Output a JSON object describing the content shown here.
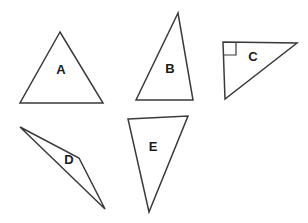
{
  "figure": {
    "background_color": "#ffffff",
    "stroke_color": "#3a3a3a",
    "label_color": "#1a1a1a",
    "width": 308,
    "height": 223,
    "triangles": [
      {
        "label": "A",
        "name": "triangle-a",
        "description": "acute isosceles triangle, apex up",
        "points": "60,32 20,103 103,103",
        "label_x": 61,
        "label_y": 71,
        "right_angle": false
      },
      {
        "label": "B",
        "name": "triangle-b",
        "description": "tall scalene triangle, apex up",
        "points": "178,13 136,100 193,100",
        "label_x": 170,
        "label_y": 70,
        "right_angle": false
      },
      {
        "label": "C",
        "name": "triangle-c",
        "description": "right triangle, right angle at top-left vertex",
        "points": "223,42 297,43 225,99",
        "label_x": 253,
        "label_y": 58,
        "right_angle": true,
        "right_angle_mark": "223,55 236,55 236,42"
      },
      {
        "label": "D",
        "name": "triangle-d",
        "description": "very thin obtuse sliver triangle",
        "points": "20,127 79,158 105,209",
        "label_x": 69,
        "label_y": 161,
        "right_angle": false
      },
      {
        "label": "E",
        "name": "triangle-e",
        "description": "scalene triangle pointing down",
        "points": "128,119 188,116 149,212",
        "label_x": 153,
        "label_y": 148,
        "right_angle": false
      }
    ]
  }
}
